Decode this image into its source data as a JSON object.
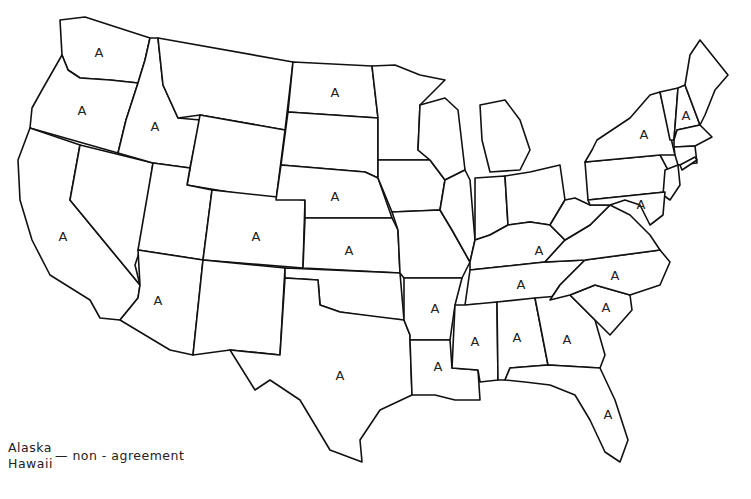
{
  "map": {
    "type": "US state outline map",
    "marker_label": "A",
    "marked_states": [
      {
        "name": "Washington",
        "label": "A",
        "x": 99,
        "y": 52
      },
      {
        "name": "Oregon",
        "label": "A",
        "x": 82,
        "y": 110
      },
      {
        "name": "Idaho",
        "label": "A",
        "x": 155,
        "y": 126
      },
      {
        "name": "North Dakota",
        "label": "A",
        "x": 335,
        "y": 92
      },
      {
        "name": "Nebraska",
        "label": "A",
        "x": 335,
        "y": 196
      },
      {
        "name": "California",
        "label": "A",
        "x": 63,
        "y": 236
      },
      {
        "name": "Colorado",
        "label": "A",
        "x": 256,
        "y": 236
      },
      {
        "name": "Kansas",
        "label": "A",
        "x": 349,
        "y": 250
      },
      {
        "name": "Arizona",
        "label": "A",
        "x": 158,
        "y": 300
      },
      {
        "name": "Texas",
        "label": "A",
        "x": 340,
        "y": 375
      },
      {
        "name": "Arkansas",
        "label": "A",
        "x": 435,
        "y": 308
      },
      {
        "name": "Louisiana",
        "label": "A",
        "x": 438,
        "y": 366
      },
      {
        "name": "Mississippi",
        "label": "A",
        "x": 475,
        "y": 341
      },
      {
        "name": "Alabama",
        "label": "A",
        "x": 517,
        "y": 337
      },
      {
        "name": "Georgia",
        "label": "A",
        "x": 567,
        "y": 339
      },
      {
        "name": "Florida",
        "label": "A",
        "x": 608,
        "y": 414
      },
      {
        "name": "South Carolina",
        "label": "A",
        "x": 606,
        "y": 307
      },
      {
        "name": "North Carolina",
        "label": "A",
        "x": 615,
        "y": 275
      },
      {
        "name": "Tennessee",
        "label": "A",
        "x": 521,
        "y": 284
      },
      {
        "name": "Kentucky",
        "label": "A",
        "x": 539,
        "y": 250
      },
      {
        "name": "New York",
        "label": "A",
        "x": 644,
        "y": 134
      },
      {
        "name": "New Hampshire",
        "label": "A",
        "x": 686,
        "y": 115
      },
      {
        "name": "Maryland",
        "label": "A",
        "x": 641,
        "y": 204
      }
    ]
  },
  "legend": {
    "names": [
      "Alaska",
      "Hawaii"
    ],
    "dash": "—",
    "description": "non - agreement"
  }
}
